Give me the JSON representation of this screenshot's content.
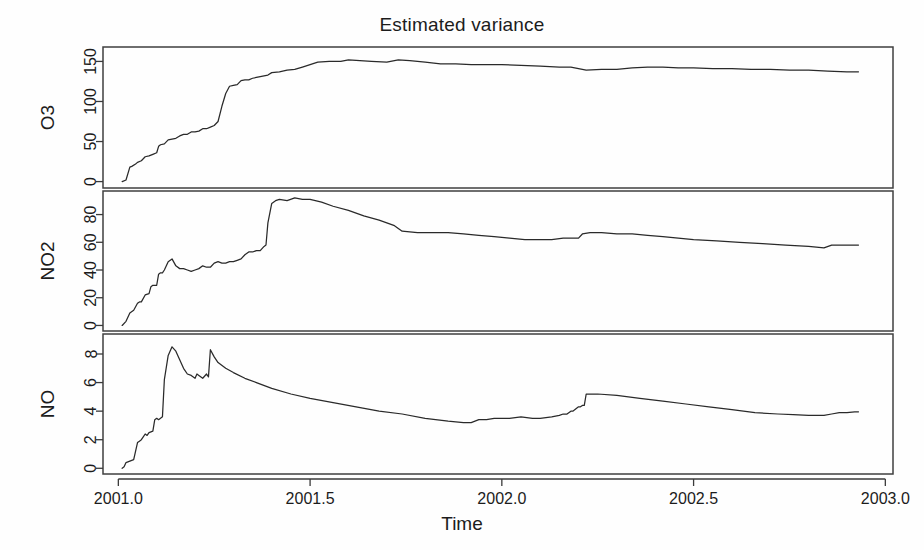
{
  "chart_data": {
    "type": "line",
    "title": "Estimated variance",
    "xlabel": "Time",
    "ylabel": "",
    "grid": false,
    "legend": "none",
    "layout": "3 stacked panels sharing x-axis",
    "xlim": [
      2000.96,
      2003.02
    ],
    "xticks": [
      2001.0,
      2001.5,
      2002.0,
      2002.5,
      2003.0
    ],
    "xticklabels": [
      "2001.0",
      "2001.5",
      "2002.0",
      "2002.5",
      "2003.0"
    ],
    "panels": [
      {
        "name": "O3",
        "ylabel": "O3",
        "ylim": [
          -8,
          168
        ],
        "yticks": [
          0,
          50,
          100,
          150
        ],
        "yticklabels": [
          "0",
          "50",
          "100",
          "150"
        ],
        "series": [
          {
            "name": "O3",
            "x": [
              2001.01,
              2001.02,
              2001.03,
              2001.035,
              2001.045,
              2001.05,
              2001.06,
              2001.07,
              2001.08,
              2001.085,
              2001.09,
              2001.1,
              2001.105,
              2001.11,
              2001.12,
              2001.13,
              2001.14,
              2001.15,
              2001.16,
              2001.17,
              2001.18,
              2001.19,
              2001.2,
              2001.21,
              2001.22,
              2001.23,
              2001.24,
              2001.25,
              2001.26,
              2001.27,
              2001.28,
              2001.29,
              2001.3,
              2001.31,
              2001.32,
              2001.33,
              2001.34,
              2001.35,
              2001.36,
              2001.37,
              2001.38,
              2001.39,
              2001.4,
              2001.42,
              2001.44,
              2001.46,
              2001.48,
              2001.5,
              2001.52,
              2001.55,
              2001.58,
              2001.6,
              2001.63,
              2001.66,
              2001.7,
              2001.73,
              2001.76,
              2001.8,
              2001.84,
              2001.88,
              2001.92,
              2001.96,
              2002.0,
              2002.05,
              2002.1,
              2002.15,
              2002.18,
              2002.2,
              2002.22,
              2002.26,
              2002.3,
              2002.34,
              2002.38,
              2002.42,
              2002.46,
              2002.5,
              2002.55,
              2002.6,
              2002.65,
              2002.7,
              2002.75,
              2002.8,
              2002.85,
              2002.9,
              2002.93
            ],
            "y": [
              0,
              2,
              18,
              19,
              22,
              24,
              26,
              31,
              32,
              33,
              34,
              36,
              44,
              46,
              47,
              52,
              53,
              54,
              57,
              59,
              59,
              62,
              62,
              63,
              66,
              66,
              68,
              70,
              75,
              94,
              110,
              119,
              120,
              121,
              126,
              127,
              127,
              129,
              130,
              131,
              132,
              133,
              136,
              137,
              139,
              140,
              143,
              146,
              149,
              150,
              150,
              152,
              151,
              150,
              149,
              152,
              151,
              149,
              147,
              147,
              146,
              146,
              146,
              145,
              144,
              143,
              143,
              141,
              139,
              140,
              140,
              142,
              143,
              143,
              142,
              142,
              141,
              141,
              140,
              140,
              139,
              139,
              138,
              137,
              137
            ]
          }
        ]
      },
      {
        "name": "NO2",
        "ylabel": "NO2",
        "ylim": [
          -4,
          97
        ],
        "yticks": [
          0,
          20,
          40,
          60,
          80
        ],
        "yticklabels": [
          "0",
          "20",
          "40",
          "60",
          "80"
        ],
        "series": [
          {
            "name": "NO2",
            "x": [
              2001.01,
              2001.02,
              2001.03,
              2001.04,
              2001.05,
              2001.055,
              2001.06,
              2001.07,
              2001.08,
              2001.085,
              2001.09,
              2001.1,
              2001.105,
              2001.11,
              2001.115,
              2001.12,
              2001.13,
              2001.14,
              2001.15,
              2001.16,
              2001.17,
              2001.18,
              2001.19,
              2001.2,
              2001.21,
              2001.22,
              2001.23,
              2001.24,
              2001.25,
              2001.26,
              2001.27,
              2001.28,
              2001.29,
              2001.3,
              2001.31,
              2001.32,
              2001.33,
              2001.34,
              2001.35,
              2001.36,
              2001.37,
              2001.38,
              2001.385,
              2001.39,
              2001.4,
              2001.41,
              2001.42,
              2001.44,
              2001.46,
              2001.48,
              2001.5,
              2001.53,
              2001.56,
              2001.6,
              2001.64,
              2001.68,
              2001.7,
              2001.72,
              2001.74,
              2001.78,
              2001.82,
              2001.86,
              2001.9,
              2001.94,
              2001.98,
              2002.02,
              2002.06,
              2002.1,
              2002.13,
              2002.16,
              2002.18,
              2002.2,
              2002.21,
              2002.23,
              2002.26,
              2002.3,
              2002.34,
              2002.38,
              2002.42,
              2002.46,
              2002.5,
              2002.56,
              2002.62,
              2002.68,
              2002.74,
              2002.8,
              2002.84,
              2002.86,
              2002.88,
              2002.9,
              2002.93
            ],
            "y": [
              0,
              3,
              9,
              11,
              16,
              17,
              17,
              22,
              23,
              28,
              29,
              29,
              37,
              38,
              38,
              40,
              46,
              48,
              43,
              41,
              41,
              40,
              39,
              40,
              41,
              43,
              42,
              42,
              45,
              46,
              45,
              45,
              46,
              46,
              47,
              48,
              51,
              53,
              53,
              54,
              54,
              57,
              58,
              74,
              88,
              90,
              91,
              90,
              92,
              91,
              91,
              89,
              86,
              83,
              79,
              76,
              74,
              72,
              68,
              67,
              67,
              67,
              66,
              65,
              64,
              63,
              62,
              62,
              62,
              63,
              63,
              63,
              66,
              67,
              67,
              66,
              66,
              65,
              64,
              63,
              62,
              61,
              60,
              59,
              58,
              57,
              56,
              58,
              58,
              58,
              58
            ]
          }
        ]
      },
      {
        "name": "NO",
        "ylabel": "NO",
        "ylim": [
          -0.4,
          9.4
        ],
        "yticks": [
          0,
          2,
          4,
          6,
          8
        ],
        "yticklabels": [
          "0",
          "2",
          "4",
          "6",
          "8"
        ],
        "series": [
          {
            "name": "NO",
            "x": [
              2001.01,
              2001.015,
              2001.02,
              2001.03,
              2001.035,
              2001.04,
              2001.05,
              2001.055,
              2001.06,
              2001.065,
              2001.07,
              2001.075,
              2001.08,
              2001.085,
              2001.09,
              2001.095,
              2001.1,
              2001.105,
              2001.11,
              2001.115,
              2001.12,
              2001.13,
              2001.14,
              2001.15,
              2001.16,
              2001.17,
              2001.18,
              2001.19,
              2001.2,
              2001.205,
              2001.21,
              2001.22,
              2001.23,
              2001.235,
              2001.24,
              2001.25,
              2001.26,
              2001.28,
              2001.3,
              2001.33,
              2001.36,
              2001.4,
              2001.45,
              2001.5,
              2001.56,
              2001.62,
              2001.68,
              2001.74,
              2001.8,
              2001.86,
              2001.9,
              2001.92,
              2001.94,
              2001.96,
              2001.98,
              2002.0,
              2002.02,
              2002.05,
              2002.08,
              2002.1,
              2002.13,
              2002.15,
              2002.16,
              2002.17,
              2002.18,
              2002.185,
              2002.19,
              2002.2,
              2002.205,
              2002.21,
              2002.215,
              2002.22,
              2002.25,
              2002.3,
              2002.36,
              2002.42,
              2002.48,
              2002.54,
              2002.6,
              2002.66,
              2002.72,
              2002.76,
              2002.8,
              2002.84,
              2002.86,
              2002.88,
              2002.9,
              2002.92,
              2002.93
            ],
            "y": [
              0.0,
              0.1,
              0.4,
              0.5,
              0.55,
              0.6,
              1.8,
              1.9,
              2.0,
              2.2,
              2.4,
              2.3,
              2.5,
              2.55,
              2.6,
              3.4,
              3.5,
              3.4,
              3.5,
              3.6,
              6.2,
              7.9,
              8.5,
              8.2,
              7.6,
              7.0,
              6.6,
              6.5,
              6.3,
              6.6,
              6.5,
              6.3,
              6.6,
              6.4,
              8.3,
              7.8,
              7.4,
              7.0,
              6.7,
              6.3,
              6.0,
              5.6,
              5.2,
              4.9,
              4.6,
              4.3,
              4.0,
              3.8,
              3.5,
              3.3,
              3.2,
              3.2,
              3.4,
              3.4,
              3.5,
              3.5,
              3.5,
              3.6,
              3.5,
              3.5,
              3.6,
              3.7,
              3.8,
              3.8,
              4.0,
              4.0,
              4.1,
              4.3,
              4.3,
              4.4,
              4.4,
              5.2,
              5.2,
              5.1,
              4.9,
              4.7,
              4.5,
              4.3,
              4.1,
              3.9,
              3.8,
              3.75,
              3.7,
              3.7,
              3.8,
              3.9,
              3.9,
              3.95,
              3.95
            ]
          }
        ]
      }
    ]
  },
  "title": {
    "text": "Estimated variance"
  },
  "axis": {
    "x_title": "Time"
  }
}
